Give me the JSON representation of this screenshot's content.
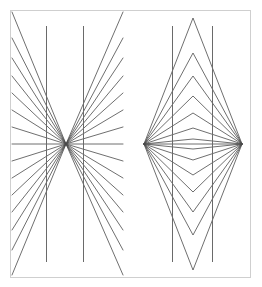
{
  "canvas": {
    "width": 262,
    "height": 287,
    "background_color": "#ffffff",
    "title": "Hering and Wundt geometrical optical illusion figures"
  },
  "frame": {
    "name": "outer-border",
    "x": 10,
    "y": 10,
    "width": 240,
    "height": 267,
    "stroke_color": "#cfcfcf",
    "stroke_width": 1
  },
  "style": {
    "line_color": "#4a4a4a",
    "line_width": 0.8,
    "vertical_line_color": "#6a6a6a",
    "vertical_line_width": 1.0
  },
  "figures": [
    {
      "id": "left-figure",
      "name": "hering-radiating-fan",
      "label": "Hering illusion",
      "vertex": {
        "x": 66,
        "y": 144
      },
      "clip": {
        "x": 11,
        "y": 11,
        "width": 119,
        "height": 265
      },
      "vertical_lines": [
        {
          "name": "vertical-line-left",
          "x": 46,
          "y1": 26,
          "y2": 262
        },
        {
          "name": "vertical-line-right",
          "x": 83,
          "y1": 26,
          "y2": 262
        }
      ],
      "ray_endpoints": [
        {
          "x": 12,
          "y": 12
        },
        {
          "x": 12,
          "y": 38
        },
        {
          "x": 12,
          "y": 58
        },
        {
          "x": 12,
          "y": 76
        },
        {
          "x": 12,
          "y": 93
        },
        {
          "x": 12,
          "y": 110
        },
        {
          "x": 12,
          "y": 127
        },
        {
          "x": 12,
          "y": 144
        },
        {
          "x": 12,
          "y": 161
        },
        {
          "x": 12,
          "y": 178
        },
        {
          "x": 12,
          "y": 195
        },
        {
          "x": 12,
          "y": 212
        },
        {
          "x": 12,
          "y": 230
        },
        {
          "x": 12,
          "y": 250
        },
        {
          "x": 12,
          "y": 275
        },
        {
          "x": 123,
          "y": 12
        },
        {
          "x": 123,
          "y": 38
        },
        {
          "x": 123,
          "y": 58
        },
        {
          "x": 123,
          "y": 76
        },
        {
          "x": 123,
          "y": 93
        },
        {
          "x": 123,
          "y": 110
        },
        {
          "x": 123,
          "y": 127
        },
        {
          "x": 123,
          "y": 144
        },
        {
          "x": 123,
          "y": 161
        },
        {
          "x": 123,
          "y": 178
        },
        {
          "x": 123,
          "y": 195
        },
        {
          "x": 123,
          "y": 212
        },
        {
          "x": 123,
          "y": 230
        },
        {
          "x": 123,
          "y": 250
        },
        {
          "x": 123,
          "y": 275
        }
      ]
    },
    {
      "id": "right-figure",
      "name": "wundt-nested-chevrons",
      "label": "Wundt illusion",
      "left_vertex": {
        "x": 144,
        "y": 144
      },
      "right_vertex": {
        "x": 242,
        "y": 144
      },
      "clip": {
        "x": 131,
        "y": 11,
        "width": 118,
        "height": 265
      },
      "vertical_lines": [
        {
          "name": "vertical-line-left",
          "x": 172,
          "y1": 26,
          "y2": 262
        },
        {
          "name": "vertical-line-right",
          "x": 212,
          "y1": 26,
          "y2": 262
        }
      ],
      "chevron_apex_y_up": [
        18,
        53,
        76,
        96,
        113,
        128,
        139
      ],
      "chevron_apex_y_down": [
        270,
        235,
        212,
        192,
        175,
        160,
        149
      ],
      "chevron_apex_x": 193,
      "axis_line": {
        "x1": 144,
        "y1": 144,
        "x2": 242,
        "y2": 144
      }
    }
  ]
}
